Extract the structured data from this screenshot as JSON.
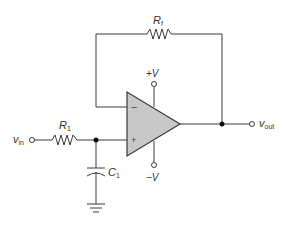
{
  "diagram": {
    "type": "op-amp active low-pass filter (non-inverting, unity-gain follower with RC input)",
    "colors": {
      "wire": "#3a3a3a",
      "opamp_fill": "#c8c8c8",
      "background": "#ffffff"
    },
    "labels": {
      "feedback_resistor": {
        "main": "R",
        "sub": "f"
      },
      "input_resistor": {
        "main": "R",
        "sub": "1"
      },
      "capacitor": {
        "main": "C",
        "sub": "1"
      },
      "input": {
        "main": "v",
        "sub": "in"
      },
      "output": {
        "main": "v",
        "sub": "out"
      },
      "positive_supply": "+V",
      "negative_supply": "−V",
      "inverting_input": "−",
      "non_inverting_input": "+"
    },
    "components": [
      {
        "id": "Rf",
        "kind": "resistor",
        "position": "feedback path, top"
      },
      {
        "id": "R1",
        "kind": "resistor",
        "position": "input series"
      },
      {
        "id": "C1",
        "kind": "capacitor",
        "position": "shunt to ground at non-inverting input"
      },
      {
        "id": "opamp",
        "kind": "operational amplifier"
      },
      {
        "id": "gnd",
        "kind": "ground"
      }
    ]
  }
}
